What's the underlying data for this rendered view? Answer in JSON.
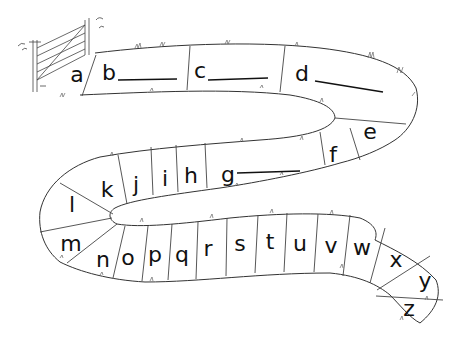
{
  "illustration": {
    "subject": "alphabet path",
    "start_object": "gate-icon",
    "letters": [
      {
        "char": "a",
        "x": 77,
        "y": 76,
        "blank": false
      },
      {
        "char": "b",
        "x": 109,
        "y": 74,
        "blank": true
      },
      {
        "char": "c",
        "x": 200,
        "y": 72,
        "blank": true
      },
      {
        "char": "d",
        "x": 302,
        "y": 75,
        "blank": true
      },
      {
        "char": "e",
        "x": 370,
        "y": 133,
        "blank": false
      },
      {
        "char": "f",
        "x": 333,
        "y": 156,
        "blank": false
      },
      {
        "char": "g",
        "x": 228,
        "y": 176,
        "blank": true
      },
      {
        "char": "h",
        "x": 191,
        "y": 177,
        "blank": false
      },
      {
        "char": "i",
        "x": 165,
        "y": 180,
        "blank": false
      },
      {
        "char": "j",
        "x": 136,
        "y": 186,
        "blank": false
      },
      {
        "char": "k",
        "x": 107,
        "y": 191,
        "blank": false
      },
      {
        "char": "l",
        "x": 72,
        "y": 206,
        "blank": false
      },
      {
        "char": "m",
        "x": 71,
        "y": 245,
        "blank": false
      },
      {
        "char": "n",
        "x": 103,
        "y": 261,
        "blank": false
      },
      {
        "char": "o",
        "x": 128,
        "y": 259,
        "blank": false
      },
      {
        "char": "p",
        "x": 155,
        "y": 256,
        "blank": false
      },
      {
        "char": "q",
        "x": 182,
        "y": 256,
        "blank": false
      },
      {
        "char": "r",
        "x": 208,
        "y": 250,
        "blank": false
      },
      {
        "char": "s",
        "x": 240,
        "y": 245,
        "blank": false
      },
      {
        "char": "t",
        "x": 270,
        "y": 243,
        "blank": false
      },
      {
        "char": "u",
        "x": 300,
        "y": 245,
        "blank": false
      },
      {
        "char": "v",
        "x": 331,
        "y": 247,
        "blank": false
      },
      {
        "char": "w",
        "x": 362,
        "y": 249,
        "blank": false
      },
      {
        "char": "x",
        "x": 396,
        "y": 261,
        "blank": false
      },
      {
        "char": "y",
        "x": 425,
        "y": 282,
        "blank": false
      },
      {
        "char": "z",
        "x": 409,
        "y": 310,
        "blank": false
      }
    ],
    "colors": {
      "ink": "#111111",
      "background": "#ffffff"
    }
  }
}
